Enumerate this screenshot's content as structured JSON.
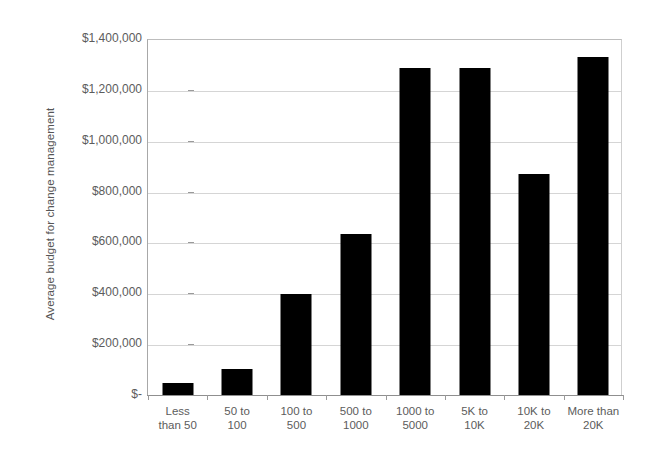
{
  "chart_data": {
    "type": "bar",
    "title": "",
    "xlabel": "",
    "ylabel": "Average budget for change management",
    "categories": [
      "Less than 50",
      "50 to 100",
      "100 to 500",
      "500 to 1000",
      "1000 to 5000",
      "5K to 10K",
      "10K to 20K",
      "More than 20K"
    ],
    "category_lines": [
      [
        "Less",
        "than 50"
      ],
      [
        "50 to",
        "100"
      ],
      [
        "100 to",
        "500"
      ],
      [
        "500 to",
        "1000"
      ],
      [
        "1000 to",
        "5000"
      ],
      [
        "5K to",
        "10K"
      ],
      [
        "10K to",
        "20K"
      ],
      [
        "More than",
        "20K"
      ]
    ],
    "values": [
      47000,
      102000,
      398000,
      635000,
      1285000,
      1287000,
      868000,
      1330000
    ],
    "ylim": [
      0,
      1400000
    ],
    "ytick_values": [
      1400000,
      1200000,
      1000000,
      800000,
      600000,
      400000,
      200000,
      0
    ],
    "ytick_labels": [
      "$1,400,000",
      "$1,200,000",
      "$1,000,000",
      "$800,000",
      "$600,000",
      "$400,000",
      "$200,000",
      "$-"
    ],
    "grid": true,
    "legend": "none",
    "bar_color": "#000000",
    "grid_color": "#d5d5d5",
    "axis_color": "#8f8f8f",
    "text_color": "#5c5c5c",
    "background": "#ffffff"
  }
}
